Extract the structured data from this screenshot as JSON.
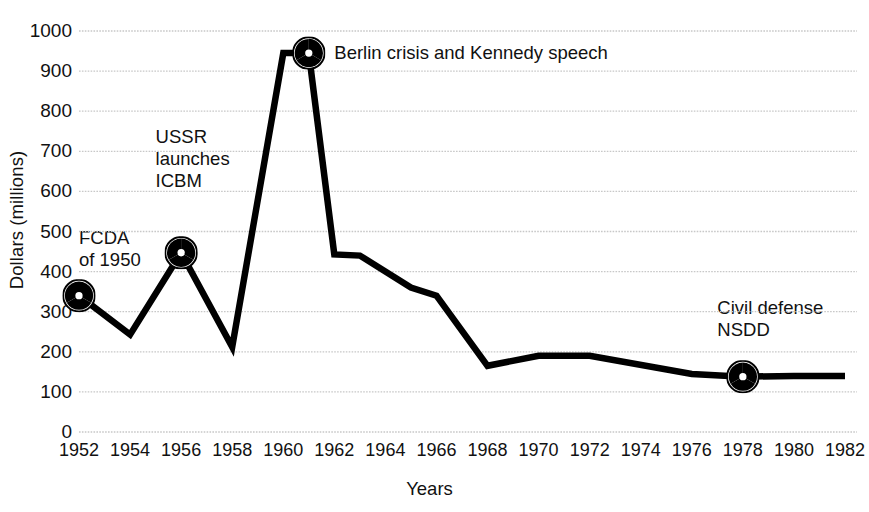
{
  "chart_data": {
    "type": "line",
    "title": "",
    "subtitle": "",
    "xlabel": "Years",
    "ylabel": "Dollars (millions)",
    "xlim": [
      1952,
      1982
    ],
    "ylim": [
      0,
      1000
    ],
    "grid": true,
    "legend": null,
    "y_ticks": [
      1000,
      900,
      800,
      700,
      600,
      500,
      400,
      300,
      200,
      100,
      0
    ],
    "y_tick_labels": [
      "1000",
      "900",
      "800",
      "700",
      "600",
      "500",
      "400",
      "300",
      "200",
      "100",
      "0"
    ],
    "x_ticks": [
      1952,
      1954,
      1956,
      1958,
      1960,
      1962,
      1964,
      1966,
      1968,
      1970,
      1972,
      1974,
      1976,
      1978,
      1980,
      1982
    ],
    "x_tick_labels": [
      "1952",
      "1954",
      "1956",
      "1958",
      "1960",
      "1962",
      "1964",
      "1966",
      "1968",
      "1970",
      "1972",
      "1974",
      "1976",
      "1978",
      "1980",
      "1982"
    ],
    "series": [
      {
        "name": "Civil defense funding",
        "color": "#000000",
        "x": [
          1952,
          1954,
          1956,
          1958,
          1960,
          1961,
          1962,
          1963,
          1965,
          1966,
          1968,
          1970,
          1972,
          1976,
          1978,
          1980,
          1982
        ],
        "values": [
          340,
          243,
          447,
          212,
          945,
          945,
          443,
          440,
          360,
          340,
          165,
          190,
          190,
          145,
          138,
          140,
          140
        ]
      }
    ],
    "markers": [
      {
        "name": "fallout-shelter-marker-fcda",
        "x": 1952,
        "y": 340
      },
      {
        "name": "fallout-shelter-marker-ussr",
        "x": 1956,
        "y": 447
      },
      {
        "name": "fallout-shelter-marker-berlin",
        "x": 1961,
        "y": 945
      },
      {
        "name": "fallout-shelter-marker-nsdd",
        "x": 1978,
        "y": 138
      }
    ],
    "annotations": [
      {
        "name": "annotation-fcda",
        "text": "FCDA\nof 1950",
        "x": 1952,
        "y": 430
      },
      {
        "name": "annotation-ussr",
        "text": "USSR\nlaunches\nICBM",
        "x": 1955,
        "y": 625
      },
      {
        "name": "annotation-berlin",
        "text": "Berlin crisis and Kennedy speech",
        "x": 1962,
        "y": 945
      },
      {
        "name": "annotation-nsdd",
        "text": "Civil defense\nNSDD",
        "x": 1977,
        "y": 255
      }
    ],
    "colors": {
      "line": "#000000",
      "grid": "#c8c8c8",
      "background": "#ffffff",
      "text": "#111111"
    }
  }
}
